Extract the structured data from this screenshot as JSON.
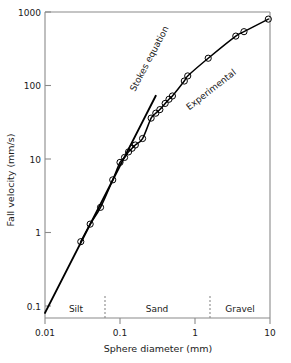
{
  "chart_data": {
    "type": "line",
    "title": "",
    "xlabel": "Sphere diameter (mm)",
    "ylabel": "Fall velocity (mm/s)",
    "xscale": "log",
    "yscale": "log",
    "xlim": [
      0.01,
      10
    ],
    "ylim": [
      0.08,
      1000
    ],
    "grid": false,
    "legend_position": "inline-annotations",
    "xticks": [
      "0.01",
      "0.1",
      "1",
      "10"
    ],
    "xtick_values": [
      0.01,
      0.1,
      1,
      10
    ],
    "yticks": [
      "1000",
      "100",
      "10",
      "1",
      "0.1"
    ],
    "ytick_values": [
      1000,
      100,
      10,
      1,
      0.1
    ],
    "series": [
      {
        "name": "Stokes equation",
        "style": "solid-line",
        "label_rotation_deg": -62,
        "x": [
          0.01,
          0.0316,
          0.1,
          0.2,
          0.3
        ],
        "y": [
          0.0805,
          0.805,
          8.05,
          32.2,
          72.5
        ]
      },
      {
        "name": "Experimental",
        "style": "solid-line-with-open-circles",
        "label_rotation_deg": -38,
        "x": [
          0.03,
          0.04,
          0.055,
          0.08,
          0.1,
          0.115,
          0.13,
          0.145,
          0.16,
          0.2,
          0.26,
          0.3,
          0.34,
          0.4,
          0.45,
          0.5,
          0.72,
          0.8,
          1.5,
          3.5,
          4.5,
          9.5
        ],
        "y": [
          0.75,
          1.3,
          2.2,
          5.2,
          9.0,
          10.5,
          12.5,
          14.0,
          15.5,
          19.0,
          36.0,
          42.0,
          47.0,
          57.0,
          65.0,
          72.0,
          115.0,
          135.0,
          235.0,
          470.0,
          540.0,
          800.0
        ]
      }
    ],
    "annotations": [
      {
        "text": "Stokes equation",
        "type": "curve-label"
      },
      {
        "text": "Experimental",
        "type": "curve-label"
      }
    ],
    "zones": [
      {
        "label": "Silt",
        "x_range": [
          0.01,
          0.0625
        ]
      },
      {
        "label": "Sand",
        "x_range": [
          0.0625,
          1.6
        ]
      },
      {
        "label": "Gravel",
        "x_range": [
          1.6,
          10
        ]
      }
    ],
    "zone_boundaries": [
      0.0625,
      1.6
    ],
    "colors": {
      "line": "#000000",
      "axis": "#888888",
      "text": "#1a1a1a",
      "marker_stroke": "#000000",
      "marker_fill": "none",
      "background": "#ffffff"
    }
  }
}
